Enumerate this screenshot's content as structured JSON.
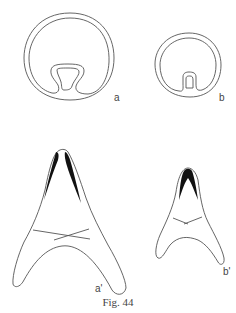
{
  "figure": {
    "caption": "Fig. 44",
    "panels": [
      {
        "id": "a",
        "label": "a",
        "description": "large ring cross-section with inward fold"
      },
      {
        "id": "b",
        "label": "b",
        "description": "small ring cross-section with inward fold"
      },
      {
        "id": "a_prime",
        "label": "a'",
        "description": "large triangular/arched structure with dark apical bands"
      },
      {
        "id": "b_prime",
        "label": "b'",
        "description": "small triangular/arched structure with dark apical band"
      }
    ],
    "colors": {
      "stroke": "#555555",
      "fill_dark": "#111111",
      "background": "#ffffff"
    }
  }
}
